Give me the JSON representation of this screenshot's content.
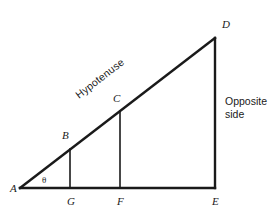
{
  "figure": {
    "type": "geometry-diagram",
    "background_color": "#ffffff",
    "stroke_color": "#1a1a1a"
  },
  "geometry": {
    "points": {
      "A": {
        "x": 20,
        "y": 188
      },
      "B": {
        "x": 70,
        "y": 149
      },
      "C": {
        "x": 120,
        "y": 111
      },
      "D": {
        "x": 215,
        "y": 38
      },
      "E": {
        "x": 215,
        "y": 188
      },
      "F": {
        "x": 120,
        "y": 188
      },
      "G": {
        "x": 70,
        "y": 188
      }
    },
    "segments": [
      {
        "name": "base-AE",
        "from": "A",
        "to": "E",
        "width": 2.4
      },
      {
        "name": "hypotenuse-AD",
        "from": "A",
        "to": "D",
        "width": 2.4
      },
      {
        "name": "opposite-DE",
        "from": "D",
        "to": "E",
        "width": 2.4
      },
      {
        "name": "perpendicular-BG",
        "from": "B",
        "to": "G",
        "width": 1.6
      },
      {
        "name": "perpendicular-CF",
        "from": "C",
        "to": "F",
        "width": 1.6
      }
    ]
  },
  "labels": {
    "A": {
      "text": "A",
      "x": 10,
      "y": 192
    },
    "B": {
      "text": "B",
      "x": 62,
      "y": 139
    },
    "C": {
      "text": "C",
      "x": 113,
      "y": 102
    },
    "D": {
      "text": "D",
      "x": 222,
      "y": 28
    },
    "E": {
      "text": "E",
      "x": 212,
      "y": 205
    },
    "F": {
      "text": "F",
      "x": 117,
      "y": 205
    },
    "G": {
      "text": "G",
      "x": 67,
      "y": 205
    },
    "theta": {
      "text": "θ",
      "x": 42,
      "y": 183
    }
  },
  "annotations": {
    "hypotenuse": {
      "text": "Hypotenuse",
      "x": 79,
      "y": 99,
      "rotation_deg": -37.6
    },
    "opposite_side": {
      "line1": "Opposite",
      "line2": "side",
      "x": 225,
      "y": 105
    }
  }
}
